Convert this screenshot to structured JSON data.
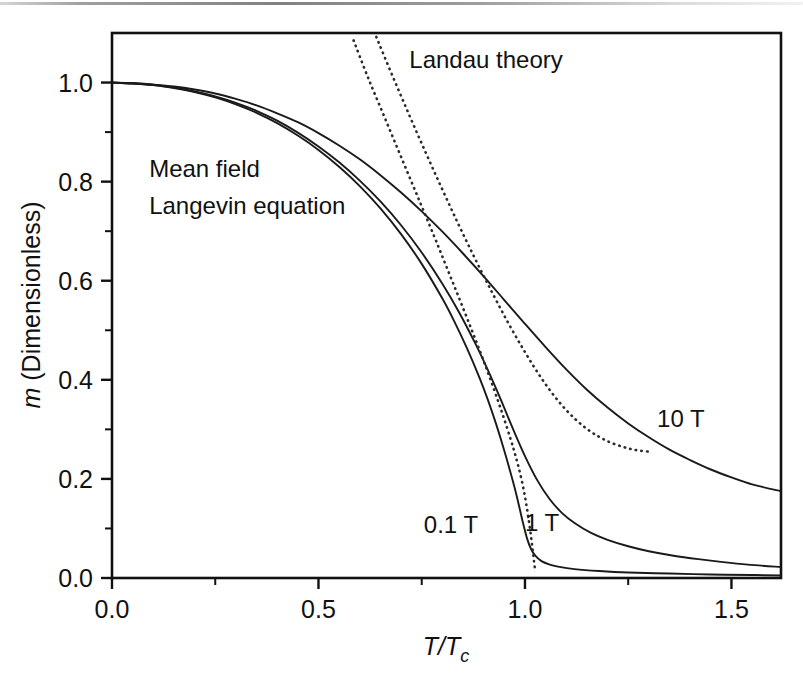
{
  "figure": {
    "background": "#ffffff",
    "frame_color": "#111111",
    "curve_color": "#1a1a1a",
    "dotted_color": "#2b2b2b"
  },
  "chart_data": {
    "type": "line",
    "title": "",
    "xlabel": "T/Tc",
    "xlabel_parts": {
      "main": "T/T",
      "subscript": "c"
    },
    "ylabel": "m (Dimensionless)",
    "ylabel_parts": {
      "italic": "m",
      "rest": " (Dimensionless)"
    },
    "xlim": [
      0.0,
      1.62
    ],
    "ylim": [
      0.0,
      1.1
    ],
    "xticks": [
      0.0,
      0.5,
      1.0,
      1.5
    ],
    "xtick_labels": [
      "0.0",
      "0.5",
      "1.0",
      "1.5"
    ],
    "xminor_ticks": [
      0.25,
      0.75,
      1.25
    ],
    "yticks": [
      0.0,
      0.2,
      0.4,
      0.6,
      0.8,
      1.0
    ],
    "ytick_labels": [
      "0.0",
      "0.2",
      "0.4",
      "0.6",
      "0.8",
      "1.0"
    ],
    "yminor_ticks": [
      0.1,
      0.3,
      0.5,
      0.7,
      0.9
    ],
    "grid": false,
    "legend": "inline-annotations",
    "annotations": [
      {
        "text": "Landau theory",
        "x": 0.72,
        "y": 1.03
      },
      {
        "text": "Mean field",
        "x": 0.09,
        "y": 0.81
      },
      {
        "text": "Langevin equation",
        "x": 0.09,
        "y": 0.735
      },
      {
        "text": "10 T",
        "x": 1.32,
        "y": 0.305
      },
      {
        "text": "1 T",
        "x": 1.0,
        "y": 0.095
      },
      {
        "text": "0.1 T",
        "x": 0.755,
        "y": 0.09
      }
    ],
    "series": [
      {
        "name": "0.1 T",
        "style": "solid",
        "points": [
          [
            0.0,
            1.0
          ],
          [
            0.05,
            0.998
          ],
          [
            0.1,
            0.995
          ],
          [
            0.15,
            0.989
          ],
          [
            0.2,
            0.981
          ],
          [
            0.25,
            0.97
          ],
          [
            0.3,
            0.956
          ],
          [
            0.35,
            0.939
          ],
          [
            0.4,
            0.918
          ],
          [
            0.45,
            0.893
          ],
          [
            0.5,
            0.864
          ],
          [
            0.55,
            0.83
          ],
          [
            0.6,
            0.791
          ],
          [
            0.65,
            0.746
          ],
          [
            0.7,
            0.694
          ],
          [
            0.75,
            0.634
          ],
          [
            0.8,
            0.564
          ],
          [
            0.83,
            0.516
          ],
          [
            0.86,
            0.463
          ],
          [
            0.89,
            0.404
          ],
          [
            0.91,
            0.36
          ],
          [
            0.93,
            0.311
          ],
          [
            0.95,
            0.257
          ],
          [
            0.965,
            0.213
          ],
          [
            0.975,
            0.182
          ],
          [
            0.985,
            0.148
          ],
          [
            0.995,
            0.112
          ],
          [
            1.005,
            0.08
          ],
          [
            1.015,
            0.058
          ],
          [
            1.025,
            0.045
          ],
          [
            1.04,
            0.034
          ],
          [
            1.06,
            0.027
          ],
          [
            1.08,
            0.023
          ],
          [
            1.12,
            0.018
          ],
          [
            1.18,
            0.014
          ],
          [
            1.25,
            0.011
          ],
          [
            1.35,
            0.009
          ],
          [
            1.45,
            0.007
          ],
          [
            1.55,
            0.006
          ],
          [
            1.62,
            0.005
          ]
        ]
      },
      {
        "name": "1 T",
        "style": "solid",
        "points": [
          [
            0.0,
            1.0
          ],
          [
            0.05,
            0.998
          ],
          [
            0.1,
            0.995
          ],
          [
            0.15,
            0.99
          ],
          [
            0.2,
            0.982
          ],
          [
            0.25,
            0.972
          ],
          [
            0.3,
            0.959
          ],
          [
            0.35,
            0.943
          ],
          [
            0.4,
            0.923
          ],
          [
            0.45,
            0.899
          ],
          [
            0.5,
            0.871
          ],
          [
            0.55,
            0.839
          ],
          [
            0.6,
            0.802
          ],
          [
            0.65,
            0.76
          ],
          [
            0.7,
            0.712
          ],
          [
            0.75,
            0.657
          ],
          [
            0.8,
            0.594
          ],
          [
            0.84,
            0.537
          ],
          [
            0.88,
            0.473
          ],
          [
            0.91,
            0.42
          ],
          [
            0.94,
            0.363
          ],
          [
            0.97,
            0.303
          ],
          [
            1.0,
            0.246
          ],
          [
            1.03,
            0.197
          ],
          [
            1.06,
            0.159
          ],
          [
            1.09,
            0.131
          ],
          [
            1.12,
            0.111
          ],
          [
            1.16,
            0.091
          ],
          [
            1.2,
            0.077
          ],
          [
            1.25,
            0.064
          ],
          [
            1.3,
            0.054
          ],
          [
            1.36,
            0.045
          ],
          [
            1.42,
            0.038
          ],
          [
            1.48,
            0.032
          ],
          [
            1.54,
            0.027
          ],
          [
            1.62,
            0.022
          ]
        ]
      },
      {
        "name": "10 T",
        "style": "solid",
        "points": [
          [
            0.0,
            1.0
          ],
          [
            0.05,
            0.999
          ],
          [
            0.1,
            0.996
          ],
          [
            0.15,
            0.992
          ],
          [
            0.2,
            0.986
          ],
          [
            0.25,
            0.978
          ],
          [
            0.3,
            0.967
          ],
          [
            0.35,
            0.954
          ],
          [
            0.4,
            0.938
          ],
          [
            0.45,
            0.92
          ],
          [
            0.5,
            0.898
          ],
          [
            0.55,
            0.873
          ],
          [
            0.6,
            0.845
          ],
          [
            0.65,
            0.813
          ],
          [
            0.7,
            0.778
          ],
          [
            0.75,
            0.74
          ],
          [
            0.8,
            0.699
          ],
          [
            0.85,
            0.655
          ],
          [
            0.9,
            0.609
          ],
          [
            0.95,
            0.561
          ],
          [
            1.0,
            0.513
          ],
          [
            1.05,
            0.466
          ],
          [
            1.1,
            0.421
          ],
          [
            1.15,
            0.38
          ],
          [
            1.2,
            0.344
          ],
          [
            1.25,
            0.312
          ],
          [
            1.3,
            0.284
          ],
          [
            1.35,
            0.259
          ],
          [
            1.4,
            0.238
          ],
          [
            1.45,
            0.219
          ],
          [
            1.5,
            0.203
          ],
          [
            1.55,
            0.189
          ],
          [
            1.62,
            0.175
          ]
        ]
      },
      {
        "name": "Landau theory (low field)",
        "style": "dotted",
        "points": [
          [
            0.585,
            1.085
          ],
          [
            0.62,
            1.01
          ],
          [
            0.66,
            0.93
          ],
          [
            0.7,
            0.85
          ],
          [
            0.74,
            0.77
          ],
          [
            0.78,
            0.69
          ],
          [
            0.81,
            0.628
          ],
          [
            0.84,
            0.566
          ],
          [
            0.87,
            0.503
          ],
          [
            0.895,
            0.449
          ],
          [
            0.915,
            0.404
          ],
          [
            0.935,
            0.357
          ],
          [
            0.95,
            0.32
          ],
          [
            0.965,
            0.281
          ],
          [
            0.975,
            0.253
          ],
          [
            0.985,
            0.222
          ],
          [
            0.995,
            0.186
          ],
          [
            1.003,
            0.15
          ],
          [
            1.01,
            0.112
          ],
          [
            1.016,
            0.075
          ],
          [
            1.021,
            0.04
          ],
          [
            1.025,
            0.012
          ]
        ]
      },
      {
        "name": "Landau theory (high field)",
        "style": "dotted",
        "points": [
          [
            0.64,
            1.092
          ],
          [
            0.68,
            1.012
          ],
          [
            0.72,
            0.934
          ],
          [
            0.76,
            0.858
          ],
          [
            0.8,
            0.784
          ],
          [
            0.84,
            0.712
          ],
          [
            0.88,
            0.643
          ],
          [
            0.92,
            0.577
          ],
          [
            0.96,
            0.514
          ],
          [
            1.0,
            0.456
          ],
          [
            1.04,
            0.403
          ],
          [
            1.08,
            0.358
          ],
          [
            1.12,
            0.322
          ],
          [
            1.16,
            0.295
          ],
          [
            1.2,
            0.276
          ],
          [
            1.24,
            0.264
          ],
          [
            1.27,
            0.258
          ],
          [
            1.3,
            0.255
          ]
        ]
      }
    ]
  },
  "axes_geometry": {
    "plot_left_px": 112,
    "plot_right_px": 781,
    "plot_top_px": 33,
    "plot_bottom_px": 578
  }
}
